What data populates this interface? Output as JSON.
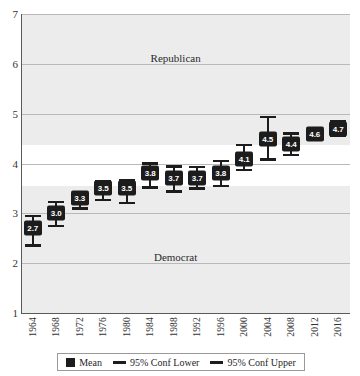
{
  "chart_data": {
    "type": "scatter",
    "title": "",
    "xlabel": "",
    "ylabel": "",
    "ylim": [
      1,
      7
    ],
    "yticks": [
      1,
      2,
      3,
      4,
      5,
      6,
      7
    ],
    "grid": true,
    "legend_position": "bottom",
    "categories": [
      "1964",
      "1968",
      "1972",
      "1976",
      "1980",
      "1984",
      "1988",
      "1992",
      "1996",
      "2000",
      "2004",
      "2008",
      "2012",
      "2016"
    ],
    "series": [
      {
        "name": "Mean",
        "values": [
          2.7,
          3.0,
          3.3,
          3.5,
          3.5,
          3.8,
          3.7,
          3.7,
          3.8,
          4.1,
          4.5,
          4.4,
          4.6,
          4.7
        ]
      },
      {
        "name": "95% Conf Lower",
        "values": [
          2.33,
          2.72,
          3.07,
          3.24,
          3.18,
          3.49,
          3.41,
          3.47,
          3.52,
          3.84,
          4.06,
          4.15,
          4.5,
          4.54
        ]
      },
      {
        "name": "95% Conf Upper",
        "values": [
          2.97,
          3.25,
          3.43,
          3.67,
          3.68,
          4.03,
          3.96,
          3.95,
          4.08,
          4.4,
          4.96,
          4.63,
          4.73,
          4.87
        ]
      }
    ],
    "point_labels": [
      "2.7",
      "3.0",
      "3.3",
      "3.5",
      "3.5",
      "3.8",
      "3.7",
      "3.7",
      "3.8",
      "4.1",
      "4.5",
      "4.4",
      "4.6",
      "4.7"
    ],
    "annotations": [
      {
        "text": "Republican",
        "x_frac": 0.47,
        "y_value": 6.12
      },
      {
        "text": "Democrat",
        "x_frac": 0.47,
        "y_value": 2.12
      }
    ],
    "legend": [
      {
        "label": "Mean",
        "marker": "square",
        "color": "#1c1c1c"
      },
      {
        "label": "95% Conf Lower",
        "marker": "line",
        "color": "#1c1c1c"
      },
      {
        "label": "95% Conf Upper",
        "marker": "line",
        "color": "#1c1c1c"
      }
    ],
    "colors": {
      "marker": "#1c1c1c",
      "label_text": "#ffffff",
      "gridline": "#b9b9b9",
      "band": "#ececec",
      "axis": "#5a5a5a",
      "background": "#ffffff"
    },
    "background_bands": [
      {
        "from": 4.38,
        "to": 7.0
      },
      {
        "from": 1.0,
        "to": 3.55
      }
    ]
  }
}
